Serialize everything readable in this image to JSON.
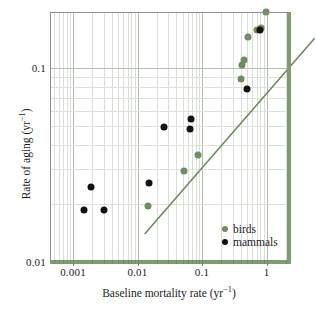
{
  "figure": {
    "type": "scatter",
    "background": "#ffffff"
  },
  "axes": {
    "x": {
      "label_html": "Baseline mortality rate (yr",
      "label_sup": "−1",
      "label_tail": ")",
      "label_plain": "Baseline mortality rate (yr−1)",
      "scale": "log",
      "min": 0.0005,
      "max": 2.2,
      "ticks": [
        "0.001",
        "0.01",
        "0.1",
        "1"
      ],
      "tick_values": [
        0.001,
        0.01,
        0.1,
        1
      ]
    },
    "y": {
      "label_html": "Rate of aging (yr",
      "label_sup": "−1",
      "label_tail": ")",
      "label_plain": "Rate of aging (yr−1)",
      "scale": "log",
      "min": 0.01,
      "max": 0.26,
      "ticks": [
        "0.1",
        "0.01"
      ],
      "tick_values": [
        0.1,
        0.01
      ]
    }
  },
  "legend": {
    "position": "bottom-right",
    "entries": [
      {
        "label": "birds",
        "color": "#6f8d5e",
        "marker": "circle"
      },
      {
        "label": "mammals",
        "color": "#121212",
        "marker": "circle"
      }
    ]
  },
  "chart_data": {
    "type": "scatter",
    "title": "",
    "xlabel": "Baseline mortality rate (yr−1)",
    "ylabel": "Rate of aging (yr−1)",
    "xscale": "log",
    "yscale": "log",
    "xlim": [
      0.0005,
      2.2
    ],
    "ylim": [
      0.01,
      0.26
    ],
    "grid": true,
    "series": [
      {
        "name": "birds",
        "color": "#6f8d5e",
        "points": [
          {
            "x": 0.0145,
            "y": 0.0195
          },
          {
            "x": 0.052,
            "y": 0.0295
          },
          {
            "x": 0.088,
            "y": 0.0355
          },
          {
            "x": 0.4,
            "y": 0.088
          },
          {
            "x": 0.42,
            "y": 0.104
          },
          {
            "x": 0.44,
            "y": 0.11
          },
          {
            "x": 0.52,
            "y": 0.145
          },
          {
            "x": 0.72,
            "y": 0.157
          },
          {
            "x": 0.82,
            "y": 0.16
          },
          {
            "x": 0.98,
            "y": 0.195
          }
        ]
      },
      {
        "name": "mammals",
        "color": "#121212",
        "points": [
          {
            "x": 0.0015,
            "y": 0.0185
          },
          {
            "x": 0.0019,
            "y": 0.0245
          },
          {
            "x": 0.003,
            "y": 0.0185
          },
          {
            "x": 0.015,
            "y": 0.0255
          },
          {
            "x": 0.0255,
            "y": 0.0495
          },
          {
            "x": 0.065,
            "y": 0.0485
          },
          {
            "x": 0.067,
            "y": 0.0545
          },
          {
            "x": 0.5,
            "y": 0.078
          },
          {
            "x": 0.8,
            "y": 0.158
          }
        ]
      }
    ],
    "trendline": {
      "name": "regression",
      "color": "#6d8a61",
      "x_start": 0.0022,
      "y_start": 0.0162,
      "x_end": 0.92,
      "y_end": 0.163
    }
  }
}
